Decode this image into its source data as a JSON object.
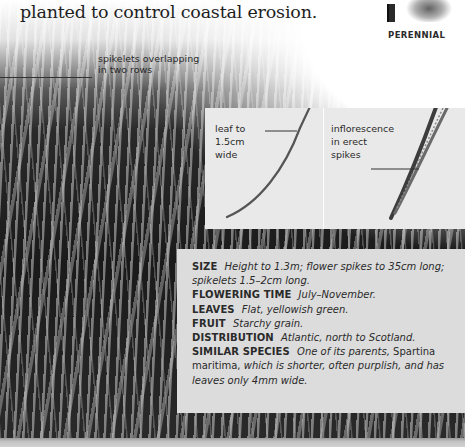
{
  "intro_text": "planted to control coastal erosion.",
  "badge": {
    "label": "PERENNIAL",
    "icons": [
      "book-icon",
      "grass-tuft-icon"
    ]
  },
  "annotations": {
    "spikelets_line1": "spikelets overlapping",
    "spikelets_line2": "in two rows",
    "leaf_line1": "leaf to",
    "leaf_line2": "1.5cm",
    "leaf_line3": "wide",
    "inflorescence_line1": "inflorescence",
    "inflorescence_line2": "in erect",
    "inflorescence_line3": "spikes"
  },
  "info": {
    "size": {
      "key": "SIZE",
      "value": "Height to 1.3m; flower spikes to 35cm long; spikelets 1.5–2cm long."
    },
    "flowering": {
      "key": "FLOWERING TIME",
      "value": "July–November."
    },
    "leaves": {
      "key": "LEAVES",
      "value": "Flat, yellowish green."
    },
    "fruit": {
      "key": "FRUIT",
      "value": "Starchy grain."
    },
    "distribution": {
      "key": "DISTRIBUTION",
      "value": "Atlantic, north to Scotland."
    },
    "similar": {
      "key": "SIMILAR SPECIES",
      "value_a": "One of its parents,",
      "value_b": "Spartina maritima,",
      "value_c": "which is shorter, often purplish, and has leaves only 4mm wide."
    }
  },
  "colors": {
    "info_panel": "#dcdcdc",
    "inset_panel": "#e9e9e9",
    "text": "#2a2a2a"
  }
}
